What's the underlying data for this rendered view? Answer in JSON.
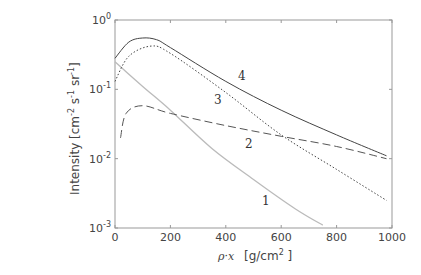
{
  "chart_data": {
    "type": "line",
    "title": "",
    "xlabel": "ρ·x  [g/cm² ]",
    "ylabel": "Intensity  [cm⁻² s⁻¹ sr⁻¹]",
    "xscale": "linear",
    "yscale": "log",
    "xlim": [
      0,
      1000
    ],
    "ylim": [
      0.001,
      1
    ],
    "xticks": [
      "0",
      "200",
      "400",
      "600",
      "800",
      "1000"
    ],
    "yticks": [
      "10^-3",
      "10^-2",
      "10^-1",
      "10^0"
    ],
    "grid": false,
    "legend": "none (inline curve labels 1–4)",
    "series": [
      {
        "name": "1",
        "style": "solid light gray",
        "x": [
          0,
          100,
          200,
          350,
          500,
          650,
          750
        ],
        "y": [
          0.25,
          0.11,
          0.05,
          0.014,
          0.005,
          0.0019,
          0.0011
        ]
      },
      {
        "name": "2",
        "style": "dashed",
        "x": [
          20,
          40,
          100,
          200,
          400,
          600,
          800,
          980
        ],
        "y": [
          0.02,
          0.045,
          0.058,
          0.045,
          0.03,
          0.021,
          0.015,
          0.01
        ]
      },
      {
        "name": "3",
        "style": "dotted",
        "x": [
          0,
          50,
          130,
          200,
          400,
          600,
          800,
          980
        ],
        "y": [
          0.13,
          0.3,
          0.42,
          0.33,
          0.09,
          0.022,
          0.007,
          0.0025
        ]
      },
      {
        "name": "4",
        "style": "solid dark",
        "x": [
          0,
          50,
          100,
          150,
          200,
          400,
          600,
          800,
          980
        ],
        "y": [
          0.28,
          0.48,
          0.55,
          0.52,
          0.4,
          0.13,
          0.05,
          0.022,
          0.011
        ]
      }
    ],
    "annotations": [
      {
        "text": "1",
        "x": 550,
        "y": 0.0019
      },
      {
        "text": "2",
        "x": 470,
        "y": 0.022
      },
      {
        "text": "3",
        "x": 360,
        "y": 0.1
      },
      {
        "text": "4",
        "x": 440,
        "y": 0.2
      }
    ]
  },
  "labels": {
    "xaxis_rho": "ρ·x",
    "xaxis_unit": "[g/cm",
    "xaxis_unit_sup": "2",
    "xaxis_unit_end": " ]",
    "yaxis_main": "Intensity  [cm",
    "yaxis_sup1": "-2",
    "yaxis_mid1": " s",
    "yaxis_sup2": "-1",
    "yaxis_mid2": " sr",
    "yaxis_sup3": "-1",
    "yaxis_end": "]",
    "curve_1": "1",
    "curve_2": "2",
    "curve_3": "3",
    "curve_4": "4"
  }
}
